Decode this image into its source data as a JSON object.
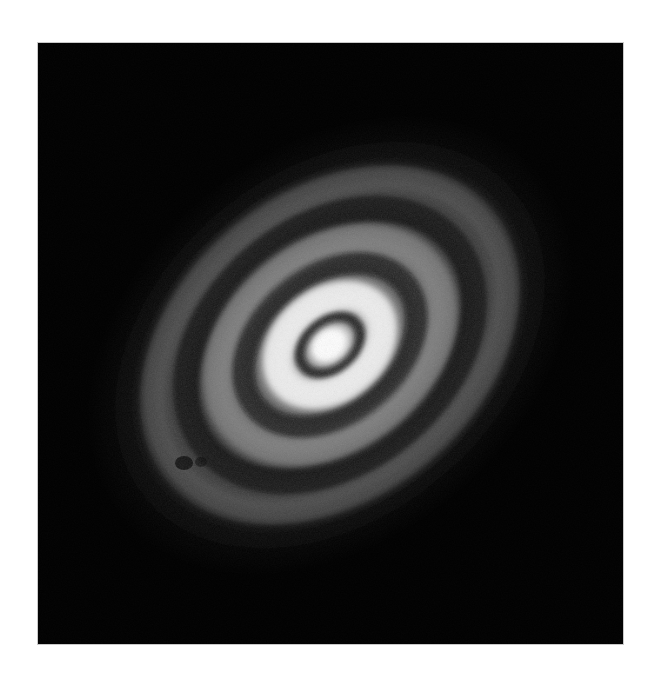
{
  "page": {
    "background_color": "#ffffff",
    "width": 654,
    "height": 677,
    "caption": ""
  },
  "panel": {
    "name": "astronomical-image-panel",
    "x": 38,
    "y": 43,
    "width": 585,
    "height": 601,
    "background_color": "#000000",
    "border_color": "#c9c9c9",
    "colormap": "grayscale",
    "label": ""
  },
  "chart_data": {
    "type": "heatmap",
    "title": "",
    "subtitle": "",
    "xlabel": "",
    "ylabel": "",
    "colormap": "grayscale",
    "background_level": 0,
    "peak_level": 255,
    "grid": false,
    "legend": "none",
    "axes_visible": false,
    "tick_labels": [],
    "annotations": [],
    "geometry": {
      "center_x_px": 330,
      "center_y_px": 345,
      "position_angle_deg": -40,
      "axis_ratio": 0.72,
      "inclination_deg": 44
    },
    "radial_profile": {
      "units": "pixels (semi-major axis)",
      "radii": [
        0,
        12,
        22,
        30,
        38,
        46,
        58,
        70,
        84,
        98,
        112,
        126,
        142,
        158,
        176,
        196,
        216,
        238,
        260
      ],
      "brightness": [
        255,
        246,
        214,
        120,
        96,
        198,
        228,
        206,
        108,
        62,
        96,
        120,
        92,
        44,
        58,
        74,
        46,
        20,
        6
      ],
      "brightness_max": 255,
      "brightness_min": 0
    },
    "features": [
      {
        "name": "core",
        "kind": "bright",
        "semi_major_px": 0,
        "semi_minor_px": 0,
        "peak_brightness": 255
      },
      {
        "name": "gap-1",
        "kind": "dark",
        "semi_major_px": 34,
        "semi_minor_px": 24,
        "peak_brightness": 96
      },
      {
        "name": "ring-1",
        "kind": "bright",
        "semi_major_px": 58,
        "semi_minor_px": 42,
        "peak_brightness": 228
      },
      {
        "name": "gap-2",
        "kind": "dark",
        "semi_major_px": 96,
        "semi_minor_px": 69,
        "peak_brightness": 60
      },
      {
        "name": "ring-2",
        "kind": "bright",
        "semi_major_px": 126,
        "semi_minor_px": 91,
        "peak_brightness": 120
      },
      {
        "name": "gap-3",
        "kind": "dark",
        "semi_major_px": 160,
        "semi_minor_px": 115,
        "peak_brightness": 42
      },
      {
        "name": "ring-3",
        "kind": "bright",
        "semi_major_px": 196,
        "semi_minor_px": 141,
        "peak_brightness": 74
      },
      {
        "name": "gap-4",
        "kind": "dark",
        "semi_major_px": 228,
        "semi_minor_px": 164,
        "peak_brightness": 22
      },
      {
        "name": "outer-halo",
        "kind": "faint",
        "semi_major_px": 262,
        "semi_minor_px": 189,
        "peak_brightness": 10
      }
    ]
  },
  "colors": {
    "background": "#ffffff",
    "sky": "#000000",
    "core_highlight": "#ffffff",
    "ring_bright": "#d8d8d8",
    "ring_mid": "#8a8a8a",
    "ring_faint": "#3a3a3a",
    "gap_dark": "#141414",
    "panel_border": "#c9c9c9"
  }
}
